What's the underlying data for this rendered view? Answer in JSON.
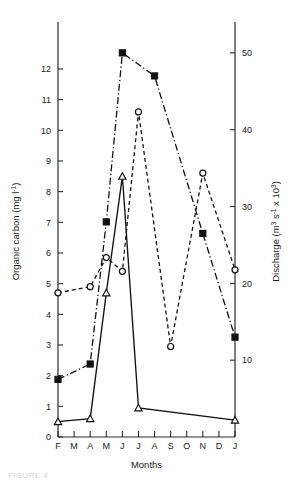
{
  "figure": {
    "caption_fragment": "FIGURE 4",
    "background_color": "#ffffff",
    "ink_color": "#111111"
  },
  "chart_data": {
    "type": "line",
    "title": "",
    "xlabel": "Months",
    "categories": [
      "F",
      "M",
      "A",
      "M",
      "J",
      "J",
      "A",
      "S",
      "O",
      "N",
      "D",
      "J"
    ],
    "grid": false,
    "legend_position": "none",
    "axes": {
      "left": {
        "label": "Organic carbon (mg l",
        "label_sup": "-1",
        "label_tail": ")",
        "ticks": [
          0,
          1,
          2,
          3,
          4,
          5,
          6,
          7,
          8,
          9,
          10,
          11,
          12
        ],
        "tick_labels": [
          "0",
          "1",
          "2",
          "3",
          "4",
          "5",
          "6",
          "7",
          "8",
          "9",
          "10",
          "11",
          "12"
        ],
        "range": [
          0,
          13.4
        ]
      },
      "right": {
        "label_head": "Discharge (m",
        "label_sup1": "3",
        "label_mid": " s",
        "label_sup2": "-1",
        "label_tail": " x 10",
        "label_sup3": "3",
        "label_close": ")",
        "ticks": [
          10,
          20,
          30,
          40,
          50
        ],
        "tick_labels": [
          "10",
          "20",
          "30",
          "40",
          "50"
        ],
        "range": [
          0,
          53.5
        ]
      }
    },
    "series": [
      {
        "name": "Organic carbon (open circles)",
        "marker": "open-circle",
        "line_style": "dashed",
        "axis": "left",
        "unit": "mg l-1",
        "points": [
          {
            "x": "F",
            "y": 4.7
          },
          {
            "x": "A",
            "y": 4.9
          },
          {
            "x": "M",
            "y": 5.85
          },
          {
            "x": "J",
            "y": 5.4
          },
          {
            "x": "J",
            "y": 10.6
          },
          {
            "x": "S",
            "y": 2.95
          },
          {
            "x": "N",
            "y": 8.6
          },
          {
            "x": "J",
            "y": 5.45
          }
        ]
      },
      {
        "name": "Organic carbon (open triangles)",
        "marker": "open-triangle",
        "line_style": "solid",
        "axis": "left",
        "unit": "mg l-1",
        "points": [
          {
            "x": "F",
            "y": 0.5
          },
          {
            "x": "A",
            "y": 0.6
          },
          {
            "x": "M",
            "y": 4.7
          },
          {
            "x": "J",
            "y": 8.5
          },
          {
            "x": "J",
            "y": 0.95
          },
          {
            "x": "J",
            "y": 0.55
          }
        ]
      },
      {
        "name": "Discharge (filled squares)",
        "marker": "filled-square",
        "line_style": "dash-dot",
        "axis": "right",
        "unit": "m3 s-1 x 10^3",
        "points": [
          {
            "x": "F",
            "y": 7.5
          },
          {
            "x": "A",
            "y": 9.5
          },
          {
            "x": "M",
            "y": 28.0
          },
          {
            "x": "J",
            "y": 50.0
          },
          {
            "x": "A",
            "y": 47.0
          },
          {
            "x": "N",
            "y": 26.5
          },
          {
            "x": "J",
            "y": 13.0
          }
        ]
      }
    ]
  }
}
